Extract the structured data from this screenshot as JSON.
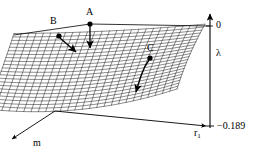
{
  "figure": {
    "type": "3d-surface-plot",
    "caption_points": [
      "A",
      "B",
      "C"
    ],
    "background_color": "#ffffff",
    "ink_color": "#000000"
  },
  "axes": {
    "vertical": {
      "name": "lambda-axis",
      "label": "λ",
      "top_tick_label": "0",
      "bottom_tick_label": "−0.189"
    },
    "depth": {
      "name": "m-axis",
      "label": "m"
    },
    "horizontal": {
      "name": "r1-axis",
      "label_base": "r",
      "label_sub": "1"
    }
  },
  "markers": [
    {
      "id": "A",
      "label": "A"
    },
    {
      "id": "B",
      "label": "B"
    },
    {
      "id": "C",
      "label": "C"
    }
  ],
  "chart_data": {
    "type": "line",
    "title": "",
    "xlabel": "r1",
    "ylabel": "λ",
    "zlabel": "m",
    "ylim": [
      -0.189,
      0
    ],
    "tick_labels": {
      "y_top": "0",
      "y_bottom": "−0.189"
    },
    "annotations": [
      {
        "text": "A",
        "role": "surface-point-with-down-arrow"
      },
      {
        "text": "B",
        "role": "surface-point-with-down-arrow"
      },
      {
        "text": "C",
        "role": "surface-point-with-curved-down-arrow"
      }
    ],
    "grid": true,
    "legend": "none"
  }
}
